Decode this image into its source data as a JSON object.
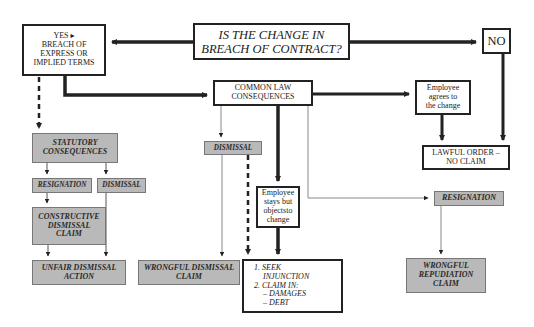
{
  "diagram": {
    "question": {
      "line1": "IS THE CHANGE IN",
      "line2": "BREACH OF CONTRACT?"
    },
    "yes_box": {
      "line1": "YES ▸",
      "line2": "BREACH OF",
      "line3": "EXPRESS OR",
      "line4": "IMPLIED TERMS"
    },
    "no_box": {
      "label": "NO"
    },
    "common_law": {
      "line1": "COMMON LAW",
      "line2": "CONSEQUENCES"
    },
    "employee_agrees": {
      "line1": "Employee",
      "line2": "agrees to",
      "line3": "the change"
    },
    "lawful_order": {
      "line1": "LAWFUL ORDER –",
      "line2": "NO CLAIM"
    },
    "statutory": {
      "line1": "STATUTORY",
      "line2": "CONSEQUENCES"
    },
    "stat_resignation": {
      "label": "RESIGNATION"
    },
    "stat_dismissal": {
      "label": "DISMISSAL"
    },
    "constructive": {
      "line1": "CONSTRUCTIVE",
      "line2": "DISMISSAL",
      "line3": "CLAIM"
    },
    "unfair_dismissal": {
      "line1": "UNFAIR DISMISSAL",
      "line2": "ACTION"
    },
    "cl_dismissal": {
      "label": "DISMISSAL"
    },
    "wrongful_dismissal": {
      "line1": "WRONGFUL DISMISSAL",
      "line2": "CLAIM"
    },
    "employee_stays": {
      "line1": "Employee",
      "line2": "stays but",
      "line3": "objectsto",
      "line4": "change"
    },
    "remedies": {
      "item1_a": "1.  SEEK",
      "item1_b": "INJUNCTION",
      "item2": "2.  CLAIM IN:",
      "sub1": "– DAMAGES",
      "sub2": "– DEBT"
    },
    "cl_resignation": {
      "label": "RESIGNATION"
    },
    "wrongful_repudiation": {
      "line1": "WRONGFUL",
      "line2": "REPUDIATION",
      "line3": "CLAIM"
    },
    "colors": {
      "ink": "#222222",
      "grey_box": "#b9b9b9",
      "thin_line": "#8a8a8a",
      "background": "#ffffff"
    }
  }
}
